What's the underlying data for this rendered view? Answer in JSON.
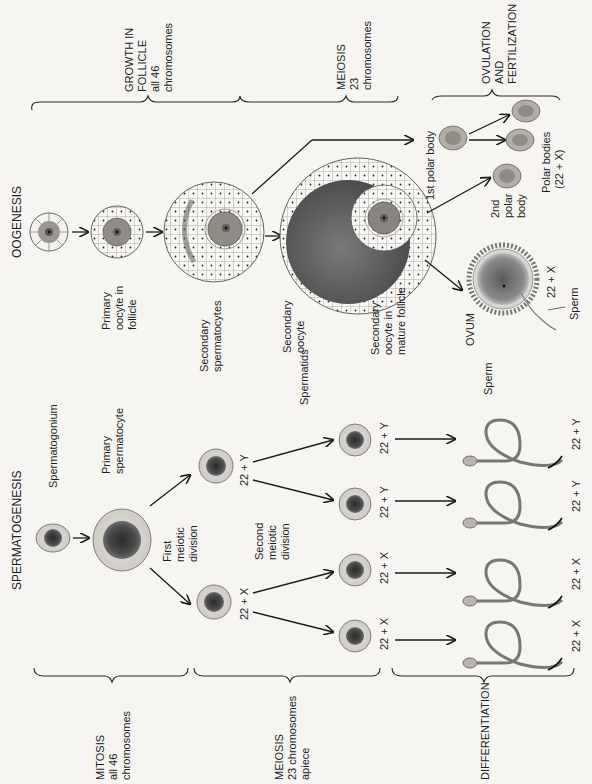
{
  "figure": {
    "orientation": "rotated-90-ccw",
    "oogenesis": {
      "title": "OOGENESIS",
      "stages": [
        {
          "label": "GROWTH IN",
          "line2": "FOLLICLE",
          "line3": "all 46",
          "line4": "chromosomes"
        },
        {
          "label": "MEIOSIS",
          "line2": "23",
          "line3": "chromosomes"
        },
        {
          "label": "OVULATION",
          "line2": "AND",
          "line3": "FERTILIZATION"
        }
      ],
      "cells": {
        "primary_oocyte": {
          "line1": "Primary",
          "line2": "oocyte in",
          "line3": "follicle"
        },
        "secondary_oocyte": {
          "line1": "Secondary",
          "line2": "oocyte"
        },
        "secondary_oocyte_mature": {
          "line1": "Secondary",
          "line2": "oocyte in",
          "line3": "mature follicle"
        },
        "first_polar_body": "1st polar body",
        "second_polar_body": {
          "line1": "2nd",
          "line2": "polar",
          "line3": "body"
        },
        "polar_bodies": {
          "line1": "Polar bodies",
          "line2": "(22 + X)"
        },
        "ovum": "OVUM",
        "ovum_karyotype": "22 + X",
        "sperm": "Sperm"
      }
    },
    "spermatogenesis": {
      "title": "SPERMATOGENESIS",
      "stages": [
        {
          "label": "MITOSIS",
          "line2": "all 46",
          "line3": "chromosomes"
        },
        {
          "label": "MEIOSIS",
          "line2": "23 chromosomes",
          "line3": "apiece"
        },
        {
          "label": "DIFFERENTIATION"
        }
      ],
      "cells": {
        "spermatogonium": "Spermatogonium",
        "primary_spermatocyte": {
          "line1": "Primary",
          "line2": "spermatocyte"
        },
        "first_meiotic_division": {
          "line1": "First",
          "line2": "meiotic",
          "line3": "division"
        },
        "secondary_spermatocytes": {
          "line1": "Secondary",
          "line2": "spermatocytes"
        },
        "second_meiotic_division": {
          "line1": "Second",
          "line2": "meiotic",
          "line3": "division"
        },
        "spermatids": "Spermatids",
        "sperm": "Sperm"
      },
      "karyotypes": {
        "secondary_x": "22 + X",
        "secondary_y": "22 + Y",
        "spermatid_1": "22 + X",
        "spermatid_2": "22 + X",
        "spermatid_3": "22 + Y",
        "spermatid_4": "22 + Y",
        "sperm_1": "22 + X",
        "sperm_2": "22 + X",
        "sperm_3": "22 + Y",
        "sperm_4": "22 + Y"
      }
    }
  }
}
